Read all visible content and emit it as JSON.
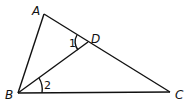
{
  "diagram": {
    "type": "triangle",
    "points": {
      "A": {
        "label": "A",
        "x": 44,
        "y": 14
      },
      "B": {
        "label": "B",
        "x": 18,
        "y": 93
      },
      "C": {
        "label": "C",
        "x": 170,
        "y": 92
      },
      "D": {
        "label": "D",
        "x": 88,
        "y": 42
      }
    },
    "segments": [
      "AB",
      "AC",
      "BC",
      "BD"
    ],
    "angles": [
      {
        "label": "1",
        "vertex": "D",
        "between": [
          "DA",
          "DB"
        ]
      },
      {
        "label": "2",
        "vertex": "B",
        "between": [
          "BD",
          "BC"
        ]
      }
    ],
    "color": "#111111"
  }
}
